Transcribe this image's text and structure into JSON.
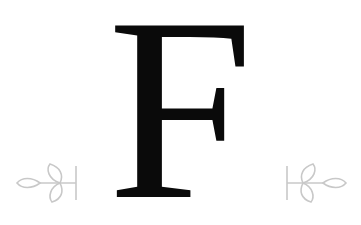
{
  "monogram": {
    "letter": "F",
    "color": "#0a0a0a"
  },
  "ornaments": {
    "left": "leaf-sprig-icon",
    "right": "leaf-sprig-icon",
    "color": "#c8c8c8"
  }
}
